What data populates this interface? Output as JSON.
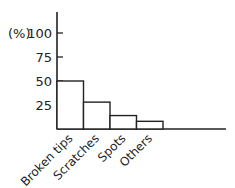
{
  "chart_data": {
    "type": "bar",
    "title": "",
    "xlabel": "",
    "ylabel": "(%)",
    "categories": [
      "Broken tips",
      "Scratches",
      "Spots",
      "Others"
    ],
    "values": [
      50,
      28,
      14,
      8
    ],
    "yticks": [
      25,
      50,
      75,
      100
    ],
    "ylim": [
      0,
      100
    ],
    "grid": false,
    "legend": null
  },
  "colors": {
    "stroke": "#222222",
    "fill": "#ffffff"
  }
}
